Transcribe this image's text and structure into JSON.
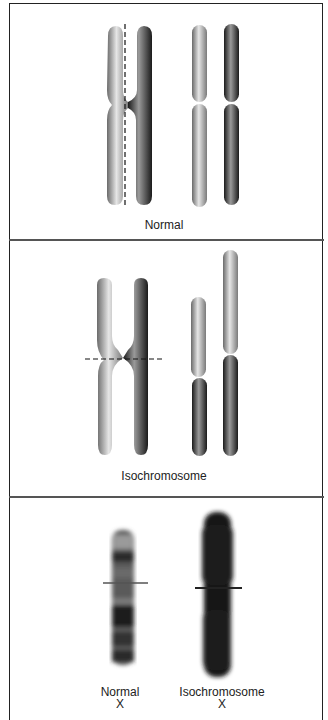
{
  "figure": {
    "panels": [
      {
        "id": "normal",
        "label": "Normal"
      },
      {
        "id": "isochromosome",
        "label": "Isochromosome"
      },
      {
        "id": "karyotype",
        "items": [
          {
            "label_line1": "Normal",
            "label_line2": "X"
          },
          {
            "label_line1": "Isochromosome",
            "label_line2": "X"
          }
        ]
      }
    ]
  }
}
